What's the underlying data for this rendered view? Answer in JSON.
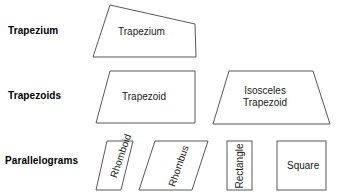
{
  "diagram": {
    "background_color": "#ffffff",
    "stroke_color": "#58585a",
    "text_color": "#1a1a1a",
    "label_color": "#000000",
    "rows": [
      {
        "label": "Trapezium",
        "shapes": [
          {
            "name": "Trapezium",
            "kind": "irregular-quadrilateral"
          }
        ]
      },
      {
        "label": "Trapezoids",
        "shapes": [
          {
            "name": "Trapezoid",
            "kind": "trapezoid"
          },
          {
            "name_line1": "Isosceles",
            "name_line2": "Trapezoid",
            "kind": "isosceles-trapezoid"
          }
        ]
      },
      {
        "label": "Parallelograms",
        "shapes": [
          {
            "name": "Rhomboid",
            "kind": "rhomboid",
            "text_rotation": "-71deg"
          },
          {
            "name": "Rhombus",
            "kind": "rhombus",
            "text_rotation": "-71deg"
          },
          {
            "name": "Rectangle",
            "kind": "rectangle",
            "text_rotation": "-90deg"
          },
          {
            "name": "Square",
            "kind": "square",
            "text_rotation": "0deg"
          }
        ]
      }
    ]
  }
}
